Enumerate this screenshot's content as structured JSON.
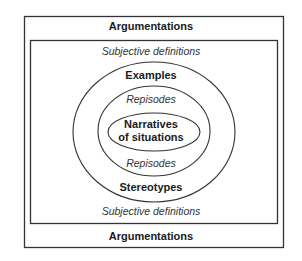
{
  "diagram": {
    "outer_box": {
      "top_label": "Argumentations",
      "bottom_label": "Argumentations"
    },
    "inner_box": {
      "top_label": "Subjective definitions",
      "bottom_label": "Subjective definitions"
    },
    "outer_ellipse": {
      "top_label": "Examples",
      "bottom_label": "Stereotypes"
    },
    "middle_ellipse": {
      "top_label": "Repisodes",
      "bottom_label": "Repisodes"
    },
    "inner_ellipse": {
      "line1": "Narratives",
      "line2": "of situations"
    },
    "colors": {
      "stroke": "#333333",
      "background": "#ffffff"
    }
  }
}
